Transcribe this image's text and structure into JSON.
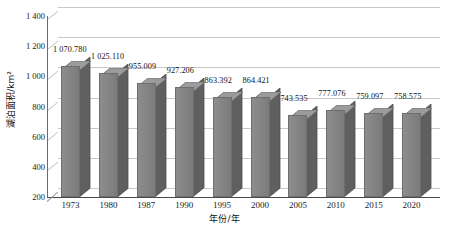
{
  "chart_data": {
    "type": "bar",
    "title": "",
    "subtitle": "",
    "xlabel": "年份/年",
    "ylabel": "湖泊面积/km²",
    "categories": [
      "1973",
      "1980",
      "1987",
      "1990",
      "1995",
      "2000",
      "2005",
      "2010",
      "2015",
      "2020"
    ],
    "values": [
      1070.78,
      1025.11,
      955.009,
      927.206,
      863.392,
      864.421,
      743.535,
      777.076,
      759.097,
      758.575
    ],
    "value_labels": [
      "1 070.780",
      "1 025.110",
      "955.009",
      "927.206",
      "863.392",
      "864.421",
      "743.535",
      "777.076",
      "759.097",
      "758.575"
    ],
    "ylim": [
      200,
      1400
    ],
    "ytick_values": [
      1400,
      1200,
      1000,
      800,
      600,
      400,
      200
    ],
    "ytick_labels": [
      "1 400",
      "1 200",
      "1 000",
      "800",
      "600",
      "400",
      "200"
    ],
    "grid": true,
    "grid_axis": "y",
    "legend": false,
    "legend_position": "none",
    "style": "3d-column",
    "colors": {
      "bar_front": "#858585",
      "bar_side": "#5f5f5f",
      "bar_top": "#9b9b9b",
      "bar_outline": "#6e6e6e",
      "gridline": "#c8c8c8",
      "axis": "#4a4a4a",
      "text": "#111111",
      "background": "#ffffff"
    }
  }
}
